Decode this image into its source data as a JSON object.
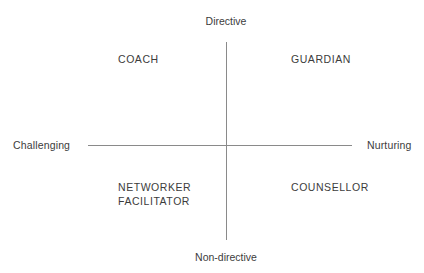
{
  "diagram": {
    "type": "2x2-quadrant-matrix",
    "background_color": "#ffffff",
    "line_color": "#8a8a8a",
    "text_color": "#3c3c3c",
    "axes": {
      "vertical": {
        "top_label": "Directive",
        "bottom_label": "Non-directive"
      },
      "horizontal": {
        "left_label": "Challenging",
        "right_label": "Nurturing"
      }
    },
    "quadrants": [
      {
        "position": "top-left",
        "label": "COACH",
        "vertical_pole": "Directive",
        "horizontal_pole": "Challenging"
      },
      {
        "position": "top-right",
        "label": "GUARDIAN",
        "vertical_pole": "Directive",
        "horizontal_pole": "Nurturing"
      },
      {
        "position": "bottom-left",
        "label": "NETWORKER\nFACILITATOR",
        "vertical_pole": "Non-directive",
        "horizontal_pole": "Challenging"
      },
      {
        "position": "bottom-right",
        "label": "COUNSELLOR",
        "vertical_pole": "Non-directive",
        "horizontal_pole": "Nurturing"
      }
    ]
  }
}
